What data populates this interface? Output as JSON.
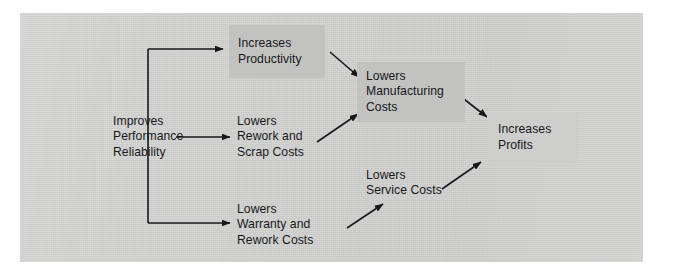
{
  "figure": {
    "kind": "flow-diagram",
    "page_background": "#ffffff",
    "plate_color": "#d2d3d1",
    "ink_color": "#17181a",
    "box_fill_dark": "#c2c3c1",
    "box_fill_light": "#cdcecc"
  },
  "nodes": [
    {
      "id": "improves-performance-reliability",
      "label": "Improves\nPerformance\nReliability",
      "style": "plain",
      "x": 113,
      "y": 112,
      "w": 105,
      "h": 50
    },
    {
      "id": "increases-productivity",
      "label": "Increases\nProductivity",
      "style": "boxed-dark",
      "x": 229,
      "y": 25,
      "w": 96,
      "h": 53,
      "text_x": 9,
      "text_y": 0
    },
    {
      "id": "lowers-rework-and-scrap-costs",
      "label": "Lowers\nRework and\nScrap Costs",
      "style": "plain",
      "x": 237,
      "y": 112,
      "w": 100,
      "h": 50
    },
    {
      "id": "lowers-warranty-and-rework-costs",
      "label": "Lowers\nWarranty and\nRework Costs",
      "style": "plain",
      "x": 237,
      "y": 200,
      "w": 105,
      "h": 50
    },
    {
      "id": "lowers-manufacturing-costs",
      "label": "Lowers\nManufacturing\nCosts",
      "style": "boxed-dark",
      "x": 357,
      "y": 62,
      "w": 108,
      "h": 60,
      "text_x": 9,
      "text_y": 0
    },
    {
      "id": "lowers-service-costs",
      "label": "Lowers\nService Costs",
      "style": "plain",
      "x": 366,
      "y": 166,
      "w": 100,
      "h": 34
    },
    {
      "id": "increases-profits",
      "label": "Increases\nProfits",
      "style": "boxed-light",
      "x": 487,
      "y": 112,
      "w": 91,
      "h": 51,
      "text_x": 11,
      "text_y": 0
    }
  ],
  "connectors": [
    {
      "id": "trunk-vertical",
      "from": "improves-performance-reliability",
      "to": "branch-trunk",
      "kind": "line",
      "points": "148,49 148,223"
    },
    {
      "id": "branch-to-increases-productivity",
      "from": "improves-performance-reliability",
      "to": "increases-productivity",
      "kind": "elbow-arrow",
      "points": "148,49 225,49"
    },
    {
      "id": "branch-to-lowers-rework-and-scrap-costs",
      "from": "improves-performance-reliability",
      "to": "lowers-rework-and-scrap-costs",
      "kind": "arrow",
      "points": "175,137 232,137"
    },
    {
      "id": "branch-to-lowers-warranty-and-rework-costs",
      "from": "improves-performance-reliability",
      "to": "lowers-warranty-and-rework-costs",
      "kind": "elbow-arrow",
      "points": "148,223 232,223"
    },
    {
      "id": "increases-productivity-to-lowers-manufacturing-costs",
      "from": "increases-productivity",
      "to": "lowers-manufacturing-costs",
      "kind": "arrow",
      "points": "329,52 361,79"
    },
    {
      "id": "lowers-rework-and-scrap-costs-to-lowers-manufacturing-costs",
      "from": "lowers-rework-and-scrap-costs",
      "to": "lowers-manufacturing-costs",
      "kind": "arrow",
      "points": "318,142 360,113"
    },
    {
      "id": "lowers-warranty-and-rework-costs-to-lowers-service-costs",
      "from": "lowers-warranty-and-rework-costs",
      "to": "lowers-service-costs",
      "kind": "arrow",
      "points": "348,228 384,203"
    },
    {
      "id": "lowers-manufacturing-costs-to-increases-profits",
      "from": "lowers-manufacturing-costs",
      "to": "increases-profits",
      "kind": "arrow",
      "points": "452,90 489,118"
    },
    {
      "id": "lowers-service-costs-to-increases-profits",
      "from": "lowers-service-costs",
      "to": "increases-profits",
      "kind": "arrow",
      "points": "443,188 483,161"
    }
  ]
}
